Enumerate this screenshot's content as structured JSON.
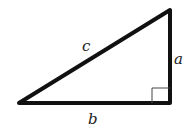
{
  "diagram": {
    "type": "right-triangle",
    "labels": {
      "hypotenuse": "c",
      "vertical_leg": "a",
      "horizontal_leg": "b"
    },
    "right_angle_marker": true,
    "colors": {
      "stroke": "#111111",
      "background": "#ffffff"
    }
  }
}
